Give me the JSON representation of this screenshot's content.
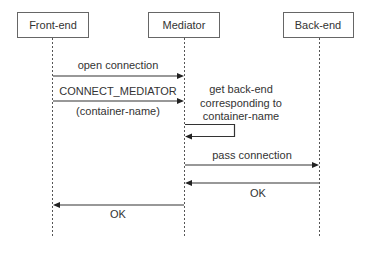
{
  "diagram": {
    "type": "sequence",
    "participants": [
      {
        "id": "frontend",
        "label": "Front-end",
        "x": 52,
        "box": [
          17,
          12,
          71,
          25
        ]
      },
      {
        "id": "mediator",
        "label": "Mediator",
        "x": 184,
        "box": [
          148,
          12,
          71,
          25
        ]
      },
      {
        "id": "backend",
        "label": "Back-end",
        "x": 319,
        "box": [
          283,
          12,
          70,
          25
        ]
      }
    ],
    "lifeline_end_y": 238,
    "messages": [
      {
        "from": "frontend",
        "to": "mediator",
        "label": "open connection",
        "sublabel": "",
        "y": 76
      },
      {
        "from": "frontend",
        "to": "mediator",
        "label": "CONNECT_MEDIATOR",
        "sublabel": "(container-name)",
        "y": 101
      },
      {
        "from": "mediator",
        "to": "mediator",
        "label_lines": [
          "get back-end",
          "corresponding to",
          "container-name"
        ],
        "y_top": 124,
        "y_bottom": 136,
        "loop_x": 234
      },
      {
        "from": "mediator",
        "to": "backend",
        "label": "pass connection",
        "sublabel": "",
        "y": 165
      },
      {
        "from": "backend",
        "to": "mediator",
        "label": "OK",
        "sublabel": "",
        "y": 183
      },
      {
        "from": "mediator",
        "to": "frontend",
        "label": "OK",
        "sublabel": "",
        "y": 205
      }
    ],
    "colors": {
      "line": "#333333",
      "box_border": "#666666",
      "text": "#333333",
      "background": "#ffffff"
    }
  }
}
